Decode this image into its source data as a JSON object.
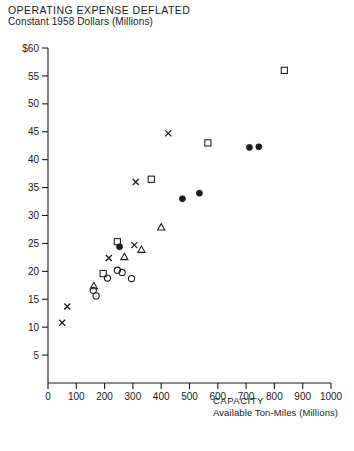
{
  "chart_data": {
    "type": "scatter",
    "title": "OPERATING EXPENSE DEFLATED",
    "subtitle": "Constant 1958 Dollars (Millions)",
    "xlabel": "CAPACITY",
    "xlabel_sub": "Available Ton-Miles (Millions)",
    "ylabel": "",
    "xlim": [
      0,
      1000
    ],
    "ylim": [
      0,
      60
    ],
    "xticks": [
      0,
      100,
      200,
      300,
      400,
      500,
      600,
      700,
      800,
      900,
      1000
    ],
    "xticklabels": [
      "0",
      "100",
      "200",
      "300",
      "400",
      "500",
      "600",
      "700",
      "800",
      "900",
      "1000"
    ],
    "yticks": [
      5,
      10,
      15,
      20,
      25,
      30,
      35,
      40,
      45,
      50,
      55,
      60
    ],
    "yticklabels": [
      "5",
      "10",
      "15",
      "20",
      "25",
      "30",
      "35",
      "40",
      "45",
      "50",
      "55",
      "$60"
    ],
    "grid": false,
    "legend": "none",
    "series": [
      {
        "name": "x-marker",
        "marker": "x",
        "points": [
          {
            "x": 50,
            "y": 10.8
          },
          {
            "x": 68,
            "y": 13.7
          },
          {
            "x": 215,
            "y": 22.4
          },
          {
            "x": 305,
            "y": 24.7
          },
          {
            "x": 310,
            "y": 36.0
          },
          {
            "x": 425,
            "y": 44.7
          }
        ]
      },
      {
        "name": "open-square",
        "marker": "square-open",
        "points": [
          {
            "x": 195,
            "y": 19.6
          },
          {
            "x": 245,
            "y": 25.3
          },
          {
            "x": 365,
            "y": 36.5
          },
          {
            "x": 565,
            "y": 43.0
          },
          {
            "x": 835,
            "y": 56.0
          }
        ]
      },
      {
        "name": "open-circle",
        "marker": "circle-open",
        "points": [
          {
            "x": 160,
            "y": 16.6
          },
          {
            "x": 170,
            "y": 15.6
          },
          {
            "x": 210,
            "y": 18.8
          },
          {
            "x": 245,
            "y": 20.2
          },
          {
            "x": 262,
            "y": 19.8
          },
          {
            "x": 295,
            "y": 18.7
          }
        ]
      },
      {
        "name": "filled-circle",
        "marker": "circle-filled",
        "points": [
          {
            "x": 253,
            "y": 24.4
          },
          {
            "x": 475,
            "y": 33.0
          },
          {
            "x": 535,
            "y": 34.0
          },
          {
            "x": 712,
            "y": 42.2
          },
          {
            "x": 745,
            "y": 42.3
          }
        ]
      },
      {
        "name": "open-triangle",
        "marker": "triangle-open",
        "points": [
          {
            "x": 162,
            "y": 17.4
          },
          {
            "x": 270,
            "y": 22.6
          },
          {
            "x": 330,
            "y": 23.9
          },
          {
            "x": 400,
            "y": 27.9
          }
        ]
      }
    ]
  },
  "colors": {
    "ink": "#1a1a1a",
    "background": "#ffffff"
  }
}
